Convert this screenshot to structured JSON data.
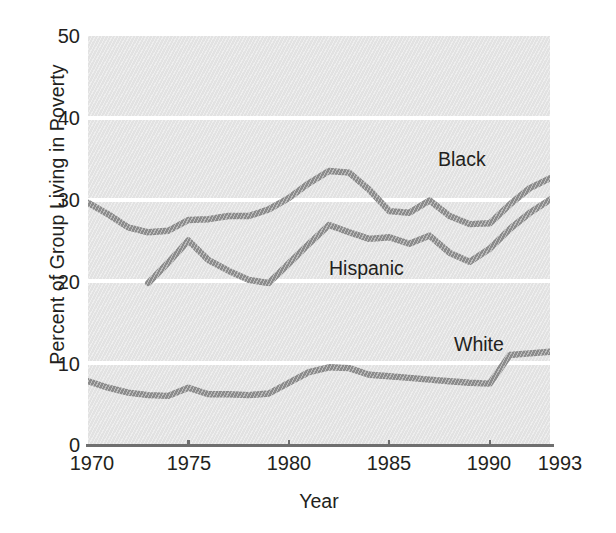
{
  "chart_data": {
    "type": "line",
    "title": "",
    "subtitle": "",
    "xlabel": "Year",
    "ylabel": "Percent of Group Living in Poverty",
    "xlim": [
      1970,
      1993
    ],
    "ylim": [
      0,
      50
    ],
    "yticks": [
      0,
      10,
      20,
      30,
      40,
      50
    ],
    "xticks": [
      1970,
      1975,
      1980,
      1985,
      1990,
      1993
    ],
    "ytick_labels": [
      "0",
      "10",
      "20",
      "30",
      "40",
      "50"
    ],
    "xtick_labels": [
      "1970",
      "1975",
      "1980",
      "1985",
      "1990",
      "1993"
    ],
    "grid": "horizontal-white-gridlines",
    "legend_position": "inline-annotations",
    "plot_background": "#e2e2e2",
    "line_color": "#8a8a8a",
    "text_color": "#231f20",
    "series": [
      {
        "name": "Black",
        "label": "Black",
        "x": [
          1970,
          1971,
          1972,
          1973,
          1974,
          1975,
          1976,
          1977,
          1978,
          1979,
          1980,
          1981,
          1982,
          1983,
          1984,
          1985,
          1986,
          1987,
          1988,
          1989,
          1990,
          1991,
          1992,
          1993
        ],
        "values": [
          29.6,
          28.2,
          26.6,
          26.0,
          26.2,
          27.5,
          27.6,
          28.0,
          28.0,
          28.8,
          30.2,
          32.0,
          33.5,
          33.3,
          31.2,
          28.6,
          28.4,
          29.9,
          28.0,
          27.0,
          27.1,
          29.4,
          31.4,
          32.6
        ],
        "color": "#8a8a8a"
      },
      {
        "name": "Hispanic",
        "label": "Hispanic",
        "x": [
          1973,
          1974,
          1975,
          1976,
          1977,
          1978,
          1979,
          1980,
          1981,
          1982,
          1983,
          1984,
          1985,
          1986,
          1987,
          1988,
          1989,
          1990,
          1991,
          1992,
          1993
        ],
        "values": [
          19.8,
          22.3,
          25.0,
          22.6,
          21.3,
          20.2,
          19.8,
          22.2,
          24.6,
          26.9,
          26.0,
          25.2,
          25.4,
          24.6,
          25.6,
          23.5,
          22.4,
          24.0,
          26.4,
          28.4,
          30.0
        ],
        "color": "#8a8a8a"
      },
      {
        "name": "White",
        "label": "White",
        "x": [
          1970,
          1971,
          1972,
          1973,
          1974,
          1975,
          1976,
          1977,
          1978,
          1979,
          1980,
          1981,
          1982,
          1983,
          1984,
          1985,
          1986,
          1987,
          1988,
          1989,
          1990,
          1991,
          1992,
          1993
        ],
        "values": [
          7.8,
          7.0,
          6.4,
          6.1,
          6.0,
          7.0,
          6.2,
          6.2,
          6.1,
          6.3,
          7.6,
          8.9,
          9.5,
          9.4,
          8.6,
          8.4,
          8.2,
          8.0,
          7.8,
          7.6,
          7.5,
          11.0,
          11.2,
          11.4
        ]
      }
    ],
    "annotations": [
      {
        "text": "Black",
        "x": 1987.4,
        "y": 36.6
      },
      {
        "text": "Hispanic",
        "x": 1982.0,
        "y": 21.9
      },
      {
        "text": "White",
        "x": 1988.2,
        "y": 13.4
      }
    ]
  }
}
